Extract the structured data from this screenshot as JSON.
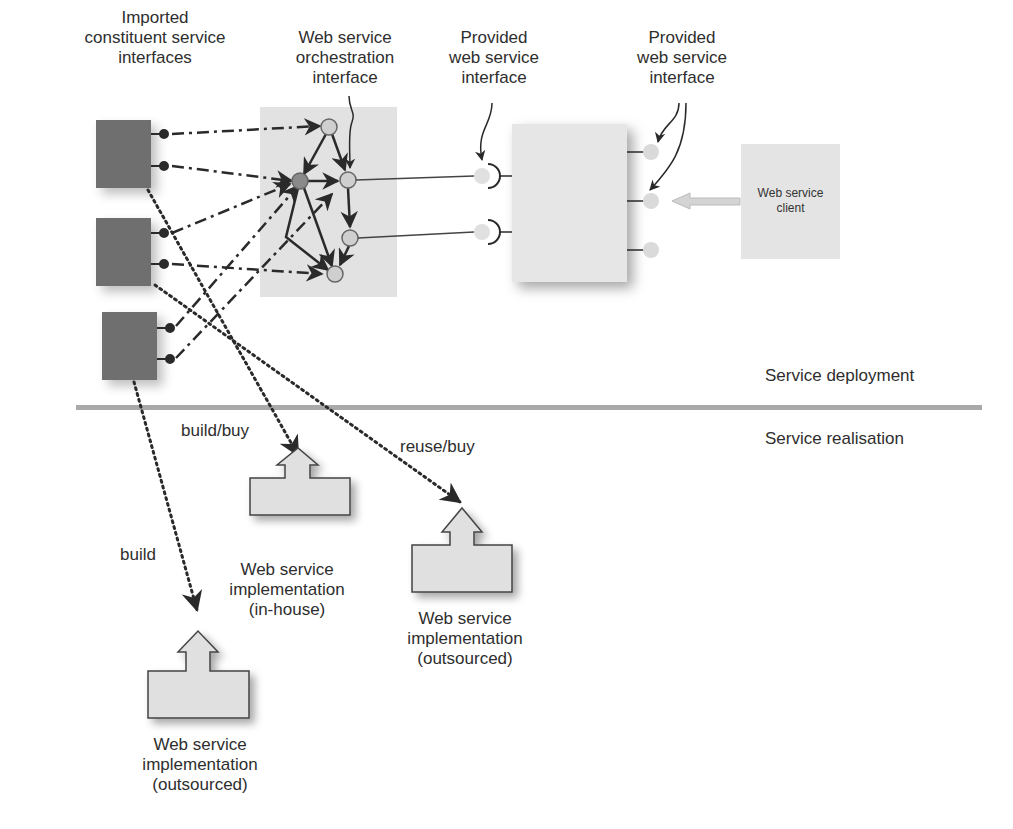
{
  "labels": {
    "imported": [
      "Imported",
      "constituent service",
      "interfaces"
    ],
    "orchestration": [
      "Web service",
      "orchestration",
      "interface"
    ],
    "provided_left": [
      "Provided",
      "web service",
      "interface"
    ],
    "provided_right": [
      "Provided",
      "web service",
      "interface"
    ],
    "client": [
      "Web service",
      "client"
    ],
    "deployment": "Service deployment",
    "realisation": "Service realisation",
    "build_buy": "build/buy",
    "reuse_buy": "reuse/buy",
    "build": "build"
  },
  "implementations": [
    {
      "id": "in-house",
      "lines": [
        "Web service",
        "implementation",
        "(in-house)"
      ],
      "edge_label": "build/buy"
    },
    {
      "id": "outsourced-right",
      "lines": [
        "Web service",
        "implementation",
        "(outsourced)"
      ],
      "edge_label": "reuse/buy"
    },
    {
      "id": "outsourced-left",
      "lines": [
        "Web service",
        "implementation",
        "(outsourced)"
      ],
      "edge_label": "build"
    }
  ],
  "colors": {
    "imported_box": "#6f6f6f",
    "panel": "#e2e2e2",
    "divider": "#a9a9a9",
    "node_fill": "#c9c9c9",
    "node_dark": "#8a8a8a",
    "line": "#2a2a2a"
  }
}
